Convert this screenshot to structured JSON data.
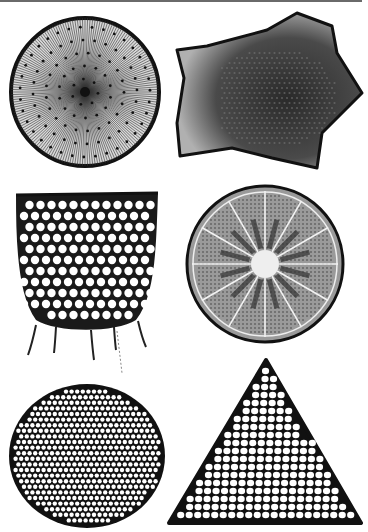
{
  "plate": {
    "background": "#ffffff",
    "rule_color": "#6a6a6a",
    "ink_color": "#111111",
    "specimens": [
      {
        "id": "radial-disc",
        "shape": "circle-radial-striae",
        "position": "top-left"
      },
      {
        "id": "star-valve",
        "shape": "five-point-star-areolate",
        "position": "top-right"
      },
      {
        "id": "basket-frustule",
        "shape": "cup-with-spines",
        "position": "middle-left"
      },
      {
        "id": "rayed-disc",
        "shape": "circle-with-hyaline-rays",
        "position": "middle-right"
      },
      {
        "id": "porous-disc",
        "shape": "circle-hexagonal-areolae",
        "position": "bottom-left"
      },
      {
        "id": "triangular-valve",
        "shape": "triangle-areolae",
        "position": "bottom-right"
      }
    ]
  }
}
